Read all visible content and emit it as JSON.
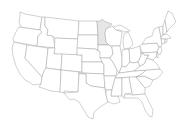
{
  "map": {
    "title": "United States",
    "highlighted_state": "Minnesota",
    "colors": {
      "background": "#ffffff",
      "state_fill": "#ffffff",
      "highlight_fill": "#e6e6e6",
      "border": "#9a9a9a"
    },
    "states": [
      {
        "name": "Washington",
        "highlighted": false
      },
      {
        "name": "Oregon",
        "highlighted": false
      },
      {
        "name": "California",
        "highlighted": false
      },
      {
        "name": "Idaho",
        "highlighted": false
      },
      {
        "name": "Nevada",
        "highlighted": false
      },
      {
        "name": "Montana",
        "highlighted": false
      },
      {
        "name": "Wyoming",
        "highlighted": false
      },
      {
        "name": "Utah",
        "highlighted": false
      },
      {
        "name": "Arizona",
        "highlighted": false
      },
      {
        "name": "Colorado",
        "highlighted": false
      },
      {
        "name": "New Mexico",
        "highlighted": false
      },
      {
        "name": "North Dakota",
        "highlighted": false
      },
      {
        "name": "South Dakota",
        "highlighted": false
      },
      {
        "name": "Nebraska",
        "highlighted": false
      },
      {
        "name": "Kansas",
        "highlighted": false
      },
      {
        "name": "Oklahoma",
        "highlighted": false
      },
      {
        "name": "Texas",
        "highlighted": false
      },
      {
        "name": "Minnesota",
        "highlighted": true
      },
      {
        "name": "Iowa",
        "highlighted": false
      },
      {
        "name": "Missouri",
        "highlighted": false
      },
      {
        "name": "Arkansas",
        "highlighted": false
      },
      {
        "name": "Louisiana",
        "highlighted": false
      },
      {
        "name": "Wisconsin",
        "highlighted": false
      },
      {
        "name": "Illinois",
        "highlighted": false
      },
      {
        "name": "Michigan",
        "highlighted": false
      },
      {
        "name": "Indiana",
        "highlighted": false
      },
      {
        "name": "Ohio",
        "highlighted": false
      },
      {
        "name": "Kentucky",
        "highlighted": false
      },
      {
        "name": "Tennessee",
        "highlighted": false
      },
      {
        "name": "Mississippi",
        "highlighted": false
      },
      {
        "name": "Alabama",
        "highlighted": false
      },
      {
        "name": "Georgia",
        "highlighted": false
      },
      {
        "name": "Florida",
        "highlighted": false
      },
      {
        "name": "South Carolina",
        "highlighted": false
      },
      {
        "name": "North Carolina",
        "highlighted": false
      },
      {
        "name": "Virginia",
        "highlighted": false
      },
      {
        "name": "West Virginia",
        "highlighted": false
      },
      {
        "name": "Pennsylvania",
        "highlighted": false
      },
      {
        "name": "New York",
        "highlighted": false
      },
      {
        "name": "Vermont",
        "highlighted": false
      },
      {
        "name": "New Hampshire",
        "highlighted": false
      },
      {
        "name": "Maine",
        "highlighted": false
      },
      {
        "name": "Massachusetts",
        "highlighted": false
      },
      {
        "name": "Connecticut",
        "highlighted": false
      },
      {
        "name": "Rhode Island",
        "highlighted": false
      },
      {
        "name": "New Jersey",
        "highlighted": false
      },
      {
        "name": "Delaware",
        "highlighted": false
      },
      {
        "name": "Maryland",
        "highlighted": false
      }
    ]
  }
}
